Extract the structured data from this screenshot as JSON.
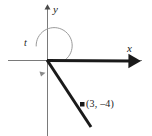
{
  "figure": {
    "kind": "coordinate-plane-angle-diagram",
    "width": 152,
    "height": 136,
    "background_color": "#ffffff",
    "ink_color": "#1a1a1a",
    "axis_color": "#6e6e6e",
    "arc_color": "#8a8a8a",
    "origin": {
      "x": 47,
      "y": 60
    }
  },
  "axes": {
    "x_axis": {
      "label": "x",
      "label_position": {
        "x": 127,
        "y": 43
      },
      "line_from": {
        "x": 8,
        "y": 60
      },
      "line_to": {
        "x": 142,
        "y": 60
      },
      "stroke_width": 1
    },
    "y_axis": {
      "label": "y",
      "label_position": {
        "x": 53,
        "y": 4
      },
      "line_from": {
        "x": 47,
        "y": 6
      },
      "line_to": {
        "x": 47,
        "y": 136
      },
      "stroke_width": 1,
      "arrowhead": "up"
    }
  },
  "angle": {
    "label": "t",
    "label_position": {
      "x": 24,
      "y": 38
    },
    "arc_radius": 18,
    "direction": "counterclockwise",
    "start_degrees": 0,
    "sweep_degrees": 307,
    "stroke_width": 1
  },
  "rays": {
    "initial_side": {
      "name": "initial-side",
      "from": {
        "x": 47,
        "y": 60
      },
      "to": {
        "x": 140,
        "y": 61
      },
      "stroke_width": 3,
      "arrowhead": "right"
    },
    "terminal_side": {
      "name": "terminal-side",
      "from": {
        "x": 47,
        "y": 60
      },
      "to": {
        "x": 91,
        "y": 127
      },
      "stroke_width": 3,
      "arrowhead": "none"
    }
  },
  "points": [
    {
      "name": "terminal-point",
      "label": "(3, –4)",
      "label_position": {
        "x": 86,
        "y": 99
      },
      "marker": {
        "x": 82,
        "y": 104,
        "size": 4,
        "shape": "square"
      },
      "coordinates": {
        "x": 3,
        "y": -4
      }
    }
  ]
}
